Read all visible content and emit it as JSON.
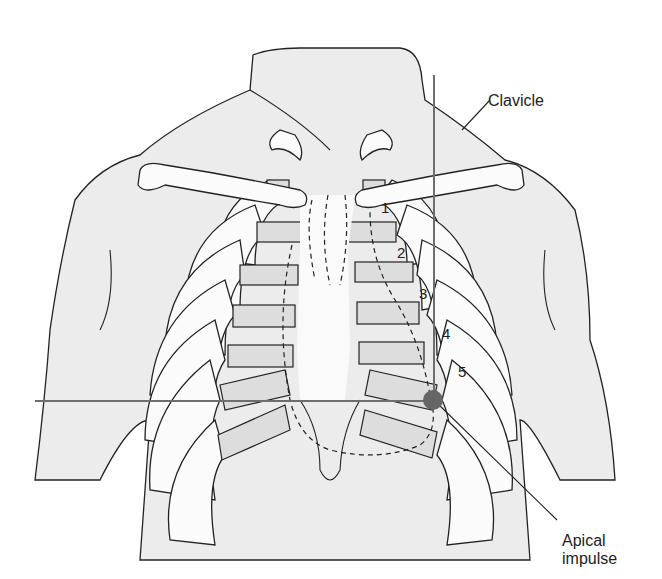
{
  "figure": {
    "labels": {
      "clavicle": "Clavicle",
      "apical_impulse_line1": "Apical",
      "apical_impulse_line2": "impulse"
    },
    "intercostal_spaces": [
      "1",
      "2",
      "3",
      "4",
      "5"
    ],
    "colors": {
      "background": "#ffffff",
      "skin": "#ececec",
      "rib": "#fbfbfb",
      "costal_cartilage": "#dddddd",
      "guide_lines": "#6e6e6e",
      "apical_marker": "#666666",
      "outline": "#222222"
    },
    "markers": {
      "apical_impulse": {
        "intercostal_space": "5",
        "position": "midclavicular line"
      }
    }
  }
}
